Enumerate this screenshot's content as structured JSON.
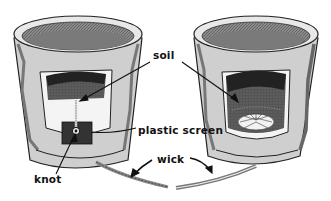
{
  "diagram": {
    "title": "",
    "colors": {
      "ink": "#111111",
      "mid": "#6e6e6e",
      "light": "#9a9a9a",
      "soil": "#4a4a4a",
      "paper": "#ffffff"
    },
    "pots": [
      {
        "id": "left-pot",
        "description": "cutaway flower pot with soil, plastic screen and knotted wick threaded through drainage hole"
      },
      {
        "id": "right-pot",
        "description": "cutaway flower pot with soil and frayed wick spread under the soil"
      }
    ],
    "labels": {
      "soil": "soil",
      "plastic_screen": "plastic screen",
      "knot": "knot",
      "wick": "wick"
    }
  }
}
